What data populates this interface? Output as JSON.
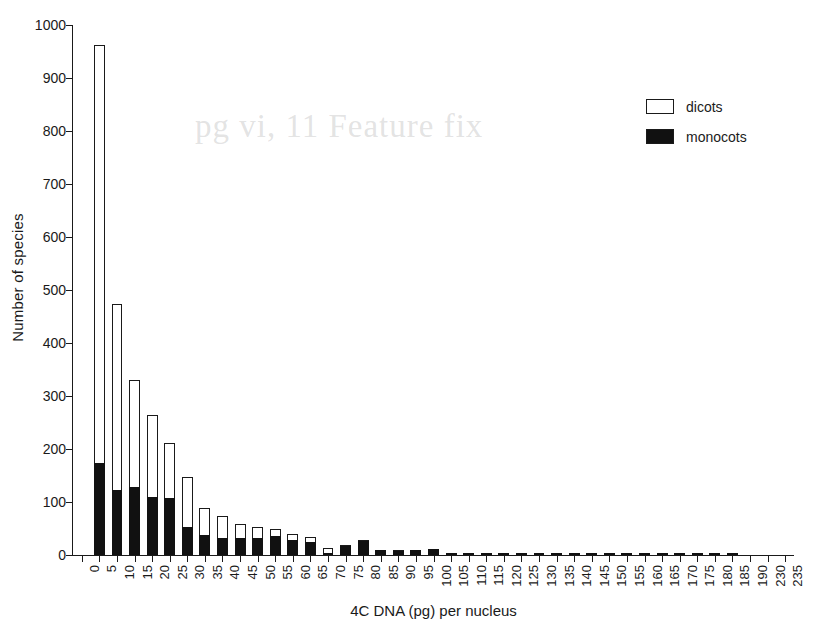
{
  "chart_data": {
    "type": "bar",
    "title": "",
    "subtitle": "",
    "xlabel": "4C DNA (pg) per nucleus",
    "ylabel": "Number of species",
    "stacked": true,
    "grid": false,
    "legend_position": "top-right",
    "ylim": [
      0,
      1000
    ],
    "yticks": [
      0,
      100,
      200,
      300,
      400,
      500,
      600,
      700,
      800,
      900,
      1000
    ],
    "categories": [
      "0",
      "5",
      "10",
      "15",
      "20",
      "25",
      "30",
      "35",
      "40",
      "45",
      "50",
      "55",
      "60",
      "65",
      "70",
      "75",
      "80",
      "85",
      "90",
      "95",
      "100",
      "105",
      "110",
      "115",
      "120",
      "125",
      "130",
      "135",
      "140",
      "145",
      "150",
      "155",
      "160",
      "165",
      "170",
      "175",
      "180",
      "185",
      "190",
      "230",
      "235"
    ],
    "series": [
      {
        "name": "monocots",
        "color": "#111111",
        "values": [
          0,
          173,
          123,
          128,
          110,
          107,
          52,
          37,
          33,
          32,
          33,
          35,
          28,
          25,
          3,
          17,
          26,
          9,
          8,
          9,
          11,
          3,
          3,
          3,
          2,
          1,
          1,
          1,
          1,
          4,
          2,
          1,
          2,
          4,
          1,
          2,
          1,
          4,
          0,
          0,
          0
        ]
      },
      {
        "name": "dicots",
        "color": "#ffffff",
        "values": [
          0,
          790,
          350,
          202,
          154,
          104,
          96,
          51,
          40,
          27,
          19,
          14,
          12,
          9,
          11,
          2,
          3,
          1,
          1,
          1,
          0,
          1,
          0,
          0,
          0,
          0,
          0,
          0,
          0,
          0,
          0,
          0,
          0,
          0,
          0,
          0,
          0,
          0,
          0,
          0,
          0
        ]
      }
    ],
    "totals": [
      0,
      963,
      473,
      330,
      264,
      211,
      148,
      88,
      73,
      59,
      52,
      49,
      40,
      34,
      14,
      19,
      29,
      10,
      9,
      10,
      11,
      4,
      3,
      3,
      2,
      1,
      1,
      1,
      1,
      4,
      2,
      1,
      2,
      4,
      1,
      2,
      1,
      4,
      0,
      0,
      0
    ]
  },
  "legend": {
    "entries": [
      {
        "label": "dicots",
        "swatch": "empty"
      },
      {
        "label": "monocots",
        "swatch": "filled"
      }
    ]
  },
  "ghost_artifact": "pg vi, 11 Feature fix"
}
